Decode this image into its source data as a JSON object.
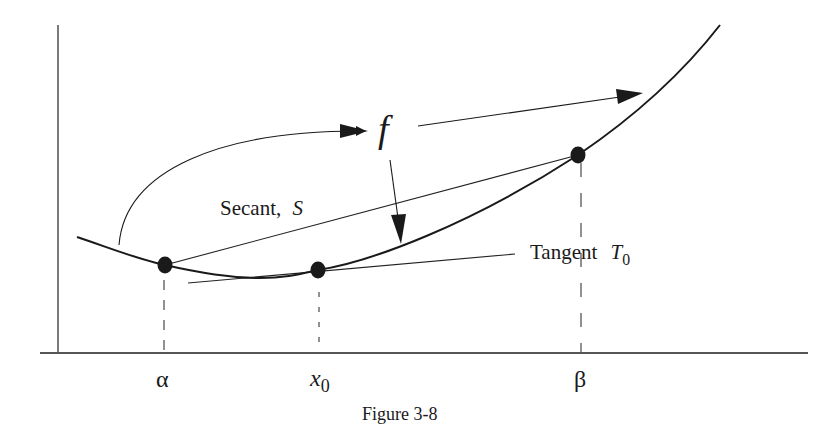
{
  "figure": {
    "caption": "Figure 3-8",
    "labels": {
      "function": "f",
      "secant": "Secant,",
      "secant_symbol": "S",
      "tangent": "Tangent",
      "tangent_symbol": "T",
      "tangent_subscript": "0",
      "alpha": "α",
      "x0_base": "x",
      "x0_subscript": "0",
      "beta": "β"
    },
    "points": [
      {
        "name": "alpha",
        "x": 165,
        "y": 265
      },
      {
        "name": "x0",
        "x": 318,
        "y": 270
      },
      {
        "name": "beta",
        "x": 578,
        "y": 155
      }
    ],
    "colors": {
      "ink": "#1a1a1a",
      "background": "#ffffff"
    }
  }
}
